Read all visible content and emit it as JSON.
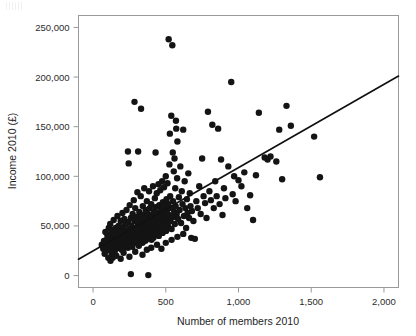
{
  "chart_data": {
    "type": "scatter",
    "title": "",
    "xlabel": "Number of members 2010",
    "ylabel": "Income 2010 (£)",
    "xlim": [
      -100,
      2100
    ],
    "ylim": [
      -12000,
      262000
    ],
    "xticks": [
      0,
      500,
      1000,
      1500,
      2000
    ],
    "xtick_labels": [
      "0",
      "500",
      "1,000",
      "1,500",
      "2,000"
    ],
    "yticks": [
      0,
      50000,
      100000,
      150000,
      200000,
      250000
    ],
    "ytick_labels": [
      "0",
      "50,000",
      "100,000",
      "150,000",
      "200,000",
      "250,000"
    ],
    "grid": false,
    "legend": null,
    "marker_color": "#141414",
    "marker_size": 3.2,
    "trendline": {
      "type": "linear-fit",
      "color": "#111111",
      "x_start": -100,
      "y_start": 16500,
      "x_end": 2100,
      "y_end": 201000,
      "slope": 83.9,
      "intercept": 24900
    },
    "points": [
      [
        60,
        31000
      ],
      [
        70,
        27000
      ],
      [
        75,
        35000
      ],
      [
        80,
        22000
      ],
      [
        85,
        44000
      ],
      [
        88,
        30000
      ],
      [
        92,
        36000
      ],
      [
        95,
        25000
      ],
      [
        98,
        41000
      ],
      [
        100,
        33000
      ],
      [
        105,
        18000
      ],
      [
        108,
        48000
      ],
      [
        110,
        29000
      ],
      [
        112,
        38000
      ],
      [
        115,
        34000
      ],
      [
        118,
        52000
      ],
      [
        120,
        26000
      ],
      [
        122,
        31000
      ],
      [
        125,
        43000
      ],
      [
        128,
        37000
      ],
      [
        130,
        21000
      ],
      [
        132,
        46000
      ],
      [
        135,
        33000
      ],
      [
        138,
        28000
      ],
      [
        140,
        39000
      ],
      [
        142,
        56000
      ],
      [
        145,
        35000
      ],
      [
        148,
        24000
      ],
      [
        150,
        42000
      ],
      [
        152,
        31000
      ],
      [
        155,
        48000
      ],
      [
        158,
        36000
      ],
      [
        160,
        27000
      ],
      [
        162,
        45000
      ],
      [
        165,
        33000
      ],
      [
        168,
        60000
      ],
      [
        170,
        38000
      ],
      [
        172,
        30000
      ],
      [
        175,
        50000
      ],
      [
        178,
        41000
      ],
      [
        180,
        34000
      ],
      [
        182,
        29000
      ],
      [
        185,
        47000
      ],
      [
        188,
        36000
      ],
      [
        190,
        55000
      ],
      [
        192,
        32000
      ],
      [
        195,
        43000
      ],
      [
        198,
        26000
      ],
      [
        200,
        38000
      ],
      [
        202,
        63000
      ],
      [
        205,
        35000
      ],
      [
        208,
        49000
      ],
      [
        210,
        31000
      ],
      [
        212,
        41000
      ],
      [
        215,
        57000
      ],
      [
        218,
        34000
      ],
      [
        220,
        45000
      ],
      [
        222,
        29000
      ],
      [
        225,
        52000
      ],
      [
        228,
        37000
      ],
      [
        230,
        66000
      ],
      [
        232,
        33000
      ],
      [
        235,
        44000
      ],
      [
        238,
        40000
      ],
      [
        240,
        28000
      ],
      [
        242,
        54000
      ],
      [
        245,
        36000
      ],
      [
        248,
        47000
      ],
      [
        250,
        31000
      ],
      [
        252,
        71000
      ],
      [
        255,
        42000
      ],
      [
        258,
        38000
      ],
      [
        260,
        58000
      ],
      [
        262,
        34000
      ],
      [
        265,
        50000
      ],
      [
        268,
        44000
      ],
      [
        270,
        29000
      ],
      [
        272,
        62000
      ],
      [
        275,
        36000
      ],
      [
        278,
        46000
      ],
      [
        280,
        76000
      ],
      [
        282,
        39000
      ],
      [
        285,
        55000
      ],
      [
        288,
        33000
      ],
      [
        290,
        68000
      ],
      [
        292,
        43000
      ],
      [
        295,
        48000
      ],
      [
        298,
        37000
      ],
      [
        300,
        59000
      ],
      [
        302,
        41000
      ],
      [
        305,
        84000
      ],
      [
        308,
        35000
      ],
      [
        310,
        52000
      ],
      [
        312,
        46000
      ],
      [
        315,
        30000
      ],
      [
        318,
        64000
      ],
      [
        320,
        39000
      ],
      [
        322,
        57000
      ],
      [
        325,
        44000
      ],
      [
        328,
        80000
      ],
      [
        330,
        36000
      ],
      [
        332,
        49000
      ],
      [
        335,
        42000
      ],
      [
        338,
        61000
      ],
      [
        340,
        33000
      ],
      [
        342,
        70000
      ],
      [
        345,
        47000
      ],
      [
        348,
        54000
      ],
      [
        350,
        38000
      ],
      [
        352,
        88000
      ],
      [
        355,
        43000
      ],
      [
        358,
        58000
      ],
      [
        360,
        35000
      ],
      [
        362,
        66000
      ],
      [
        365,
        50000
      ],
      [
        368,
        41000
      ],
      [
        370,
        75000
      ],
      [
        372,
        46000
      ],
      [
        375,
        37000
      ],
      [
        378,
        62000
      ],
      [
        380,
        53000
      ],
      [
        382,
        44000
      ],
      [
        385,
        85000
      ],
      [
        388,
        39000
      ],
      [
        390,
        68000
      ],
      [
        392,
        48000
      ],
      [
        395,
        57000
      ],
      [
        398,
        42000
      ],
      [
        400,
        72000
      ],
      [
        402,
        36000
      ],
      [
        405,
        60000
      ],
      [
        408,
        51000
      ],
      [
        410,
        45000
      ],
      [
        412,
        90000
      ],
      [
        415,
        38000
      ],
      [
        418,
        64000
      ],
      [
        420,
        55000
      ],
      [
        422,
        47000
      ],
      [
        425,
        78000
      ],
      [
        428,
        41000
      ],
      [
        430,
        69000
      ],
      [
        432,
        58000
      ],
      [
        435,
        50000
      ],
      [
        438,
        83000
      ],
      [
        440,
        44000
      ],
      [
        442,
        63000
      ],
      [
        445,
        56000
      ],
      [
        448,
        48000
      ],
      [
        450,
        92000
      ],
      [
        452,
        40000
      ],
      [
        455,
        71000
      ],
      [
        458,
        61000
      ],
      [
        460,
        53000
      ],
      [
        462,
        86000
      ],
      [
        465,
        46000
      ],
      [
        468,
        67000
      ],
      [
        470,
        59000
      ],
      [
        472,
        51000
      ],
      [
        475,
        95000
      ],
      [
        478,
        43000
      ],
      [
        480,
        74000
      ],
      [
        482,
        64000
      ],
      [
        485,
        56000
      ],
      [
        488,
        89000
      ],
      [
        490,
        49000
      ],
      [
        492,
        70000
      ],
      [
        495,
        62000
      ],
      [
        498,
        54000
      ],
      [
        500,
        100000
      ],
      [
        502,
        45000
      ],
      [
        505,
        77000
      ],
      [
        508,
        66000
      ],
      [
        510,
        58000
      ],
      [
        512,
        93000
      ],
      [
        515,
        50000
      ],
      [
        518,
        72000
      ],
      [
        520,
        238000
      ],
      [
        522,
        61000
      ],
      [
        525,
        112000
      ],
      [
        528,
        143000
      ],
      [
        530,
        80000
      ],
      [
        532,
        55000
      ],
      [
        535,
        68000
      ],
      [
        538,
        161000
      ],
      [
        540,
        47000
      ],
      [
        545,
        232000
      ],
      [
        548,
        124000
      ],
      [
        550,
        75000
      ],
      [
        552,
        59000
      ],
      [
        555,
        105000
      ],
      [
        558,
        64000
      ],
      [
        560,
        118000
      ],
      [
        562,
        52000
      ],
      [
        565,
        88000
      ],
      [
        568,
        70000
      ],
      [
        570,
        156000
      ],
      [
        572,
        148000
      ],
      [
        575,
        62000
      ],
      [
        578,
        98000
      ],
      [
        580,
        135000
      ],
      [
        585,
        57000
      ],
      [
        590,
        79000
      ],
      [
        595,
        66000
      ],
      [
        600,
        110000
      ],
      [
        605,
        53000
      ],
      [
        610,
        85000
      ],
      [
        615,
        72000
      ],
      [
        620,
        147000
      ],
      [
        625,
        60000
      ],
      [
        630,
        95000
      ],
      [
        635,
        68000
      ],
      [
        640,
        48000
      ],
      [
        645,
        77000
      ],
      [
        650,
        63000
      ],
      [
        655,
        103000
      ],
      [
        660,
        58000
      ],
      [
        665,
        83000
      ],
      [
        670,
        70000
      ],
      [
        675,
        38000
      ],
      [
        680,
        65000
      ],
      [
        690,
        55000
      ],
      [
        700,
        37000
      ],
      [
        710,
        75000
      ],
      [
        720,
        68000
      ],
      [
        730,
        90000
      ],
      [
        740,
        62000
      ],
      [
        750,
        118000
      ],
      [
        760,
        80000
      ],
      [
        770,
        73000
      ],
      [
        780,
        58000
      ],
      [
        790,
        165000
      ],
      [
        800,
        85000
      ],
      [
        810,
        76000
      ],
      [
        820,
        152000
      ],
      [
        830,
        68000
      ],
      [
        840,
        95000
      ],
      [
        850,
        80000
      ],
      [
        860,
        148000
      ],
      [
        870,
        72000
      ],
      [
        880,
        117000
      ],
      [
        890,
        61000
      ],
      [
        900,
        88000
      ],
      [
        910,
        78000
      ],
      [
        930,
        110000
      ],
      [
        950,
        195000
      ],
      [
        960,
        82000
      ],
      [
        970,
        100000
      ],
      [
        980,
        75000
      ],
      [
        1000,
        96000
      ],
      [
        1020,
        90000
      ],
      [
        1040,
        104000
      ],
      [
        1060,
        68000
      ],
      [
        1080,
        81000
      ],
      [
        1100,
        56000
      ],
      [
        1120,
        101000
      ],
      [
        1140,
        164000
      ],
      [
        1180,
        119000
      ],
      [
        1200,
        117000
      ],
      [
        1220,
        120000
      ],
      [
        1260,
        115000
      ],
      [
        1280,
        147000
      ],
      [
        1300,
        97000
      ],
      [
        1330,
        171000
      ],
      [
        1360,
        151000
      ],
      [
        1520,
        140000
      ],
      [
        1560,
        99000
      ],
      [
        260,
        1500
      ],
      [
        380,
        500
      ],
      [
        240,
        125000
      ],
      [
        310,
        125000
      ],
      [
        245,
        113000
      ],
      [
        285,
        175000
      ],
      [
        330,
        168000
      ],
      [
        430,
        124000
      ],
      [
        120,
        15000
      ],
      [
        135,
        18000
      ],
      [
        160,
        20000
      ],
      [
        190,
        17000
      ],
      [
        210,
        23000
      ],
      [
        250,
        19000
      ],
      [
        290,
        24000
      ],
      [
        340,
        21000
      ],
      [
        370,
        26000
      ],
      [
        400,
        28000
      ],
      [
        440,
        31000
      ],
      [
        470,
        27000
      ],
      [
        500,
        33000
      ],
      [
        540,
        36000
      ],
      [
        580,
        39000
      ],
      [
        620,
        42000
      ]
    ]
  }
}
